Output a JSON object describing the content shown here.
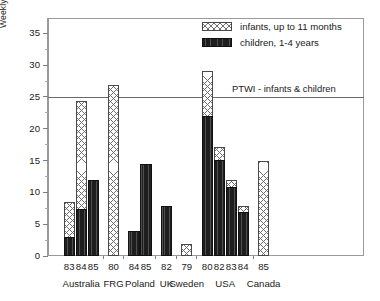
{
  "chart_data": {
    "type": "bar",
    "title": "",
    "xlabel": "",
    "ylabel": "Weekly dietary intake (µg/kg body weight)",
    "ylim": [
      0,
      37.4
    ],
    "yticks": [
      0,
      5,
      10,
      15,
      20,
      25,
      30,
      35
    ],
    "ytick_labels": [
      "0",
      "5",
      "10",
      "15",
      "20",
      "25",
      "30",
      "35"
    ],
    "yminor_step": 2.5,
    "grid": false,
    "legend_position": "top-right",
    "categories": [
      "83",
      "84",
      "85",
      "80",
      "84",
      "85",
      "82",
      "79",
      "80",
      "82",
      "83",
      "84",
      "85"
    ],
    "groups": [
      {
        "country": "Australia",
        "years": [
          "83",
          "84",
          "85"
        ]
      },
      {
        "country": "FRG",
        "years": [
          "80"
        ]
      },
      {
        "country": "Poland",
        "years": [
          "84",
          "85"
        ]
      },
      {
        "country": "UK",
        "years": [
          "82"
        ]
      },
      {
        "country": "Sweden",
        "years": [
          "79"
        ]
      },
      {
        "country": "USA",
        "years": [
          "80",
          "82",
          "83",
          "84"
        ]
      },
      {
        "country": "Canada",
        "years": [
          "85"
        ]
      }
    ],
    "series": [
      {
        "name": "infants, up to 11 months",
        "values": [
          8.5,
          24.4,
          null,
          26.9,
          null,
          null,
          null,
          1.9,
          29.0,
          17.1,
          12.0,
          7.9,
          15.0
        ]
      },
      {
        "name": "children, 1-4 years",
        "values": [
          3.0,
          7.4,
          12.0,
          null,
          4.0,
          14.4,
          7.9,
          null,
          22.0,
          15.1,
          10.9,
          6.9,
          null
        ]
      }
    ],
    "reference_line": {
      "label": "PTWI - infants & children",
      "value": 25
    },
    "annotations": []
  },
  "legend": {
    "items": [
      {
        "label": "infants, up to 11 months",
        "pattern": "crosshatch-light"
      },
      {
        "label": "children, 1-4 years",
        "pattern": "dense-dark"
      }
    ]
  }
}
